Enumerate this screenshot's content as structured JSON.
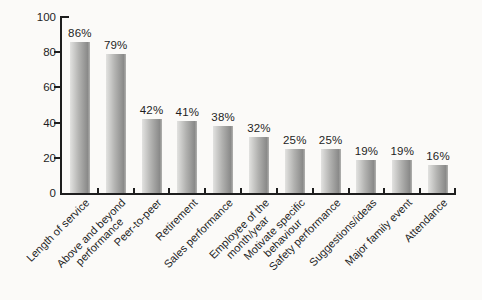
{
  "chart_data": {
    "type": "bar",
    "title": "",
    "xlabel": "",
    "ylabel": "",
    "categories": [
      "Length of service",
      "Above and beyond\nperformance",
      "Peer-to-peer",
      "Retirement",
      "Sales performance",
      "Employee of the\nmonth/year",
      "Motivate specific\nbehaviour",
      "Safety performance",
      "Suggestions/ideas",
      "Major family event",
      "Attendance"
    ],
    "values": [
      86,
      79,
      42,
      41,
      38,
      32,
      25,
      25,
      19,
      19,
      16
    ],
    "value_labels": [
      "86%",
      "79%",
      "42%",
      "41%",
      "38%",
      "32%",
      "25%",
      "25%",
      "19%",
      "19%",
      "16%"
    ],
    "ylim": [
      0,
      100
    ],
    "yticks": [
      0,
      20,
      40,
      60,
      80,
      100
    ],
    "ytick_labels": [
      "0",
      "20",
      "40",
      "60",
      "80",
      "100"
    ],
    "grid": false,
    "legend_position": "none",
    "x_label_rotation_deg": -45,
    "colors": {
      "bar_gradient_left": "#e2e2e0",
      "bar_gradient_mid": "#b2b2b0",
      "bar_gradient_right": "#8a8a89",
      "axis": "#1e1e1e",
      "text": "#1e1e1e",
      "background": "#fbfaf8"
    }
  }
}
